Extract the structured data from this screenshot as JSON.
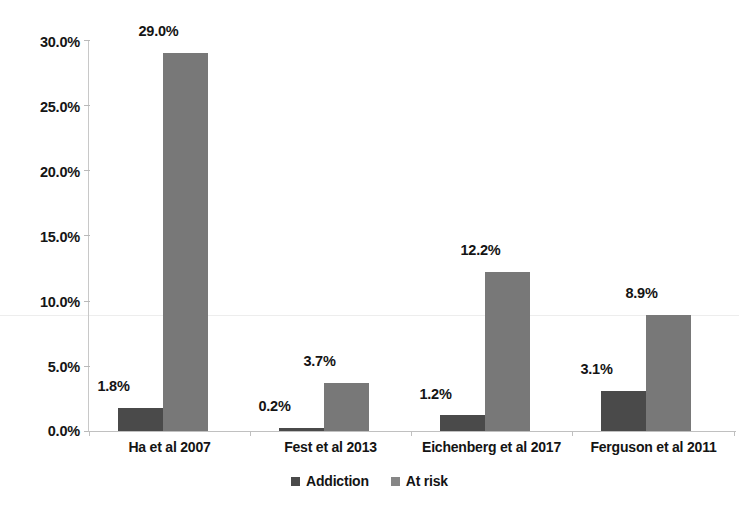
{
  "chart_data": {
    "type": "bar",
    "title": "",
    "subtitle": "",
    "xlabel": "",
    "ylabel": "",
    "categories": [
      "Ha et al 2007",
      "Fest et al 2013",
      "Eichenberg et al 2017",
      "Ferguson et al 2011"
    ],
    "series": [
      {
        "name": "Addiction",
        "color": "#4a4a4a",
        "values": [
          1.8,
          0.2,
          1.2,
          3.1
        ],
        "value_labels": [
          "1.8%",
          "0.2%",
          "1.2%",
          "3.1%"
        ]
      },
      {
        "name": "At risk",
        "color": "#787878",
        "values": [
          29.0,
          3.7,
          12.2,
          8.9
        ],
        "value_labels": [
          "29.0%",
          "3.7%",
          "12.2%",
          "8.9%"
        ]
      }
    ],
    "ylim": [
      0,
      30
    ],
    "ytick_values": [
      0,
      5,
      10,
      15,
      20,
      25,
      30
    ],
    "ytick_labels": [
      "0.0%",
      "5.0%",
      "10.0%",
      "15.0%",
      "20.0%",
      "25.0%",
      "30.0%"
    ],
    "grid": false,
    "legend_position": "bottom",
    "legend_entries": [
      "Addiction",
      "At risk"
    ],
    "value_label_format": "percent-one-decimal"
  }
}
